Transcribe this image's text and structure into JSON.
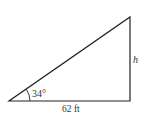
{
  "diagram": {
    "type": "right-triangle",
    "vertices": {
      "bottom_left": [
        9,
        101
      ],
      "bottom_right": [
        130,
        101
      ],
      "top_right": [
        130,
        17
      ]
    },
    "angle_label": "34°",
    "base_label": "62 ft",
    "height_label": "h",
    "colors": {
      "stroke": "#222222",
      "text": "#333333",
      "background": "#ffffff"
    }
  }
}
